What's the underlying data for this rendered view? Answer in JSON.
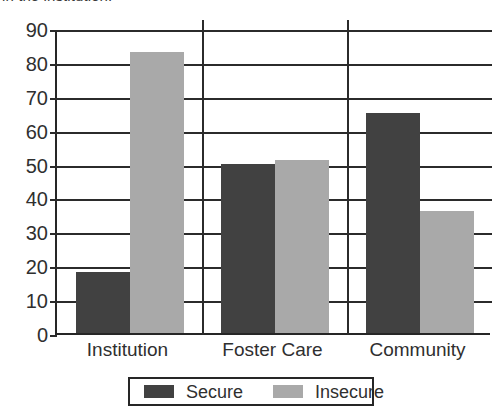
{
  "caption": {
    "truncated_text": "in the institution."
  },
  "legend": {
    "position": "bottom-center",
    "entries": [
      {
        "label": "Secure",
        "color": "#414141",
        "swatch_name": "legend-swatch-secure"
      },
      {
        "label": "Insecure",
        "color": "#a9a9a9",
        "swatch_name": "legend-swatch-insecure"
      }
    ]
  },
  "axes": {
    "y_ticks": [
      "90",
      "80",
      "70",
      "60",
      "50",
      "40",
      "30",
      "20",
      "10",
      "0"
    ],
    "x_ticks": [
      "Institution",
      "Foster Care",
      "Community"
    ]
  },
  "chart_data": {
    "type": "bar",
    "title": "",
    "subtitle": "",
    "caption_fragment": "in the institution.",
    "categories": [
      "Institution",
      "Foster Care",
      "Community"
    ],
    "series": [
      {
        "name": "Secure",
        "color": "#414141",
        "values": [
          18,
          50,
          65
        ]
      },
      {
        "name": "Insecure",
        "color": "#a9a9a9",
        "values": [
          83,
          51,
          36
        ]
      }
    ],
    "xlabel": "",
    "ylabel": "",
    "ylim": [
      0,
      90
    ],
    "ytick_step": 10,
    "yticks": [
      0,
      10,
      20,
      30,
      40,
      50,
      60,
      70,
      80,
      90
    ],
    "grid": "horizontal",
    "group_separators": true,
    "legend_position": "bottom-center",
    "bar_style": "grouped-adjacent"
  }
}
